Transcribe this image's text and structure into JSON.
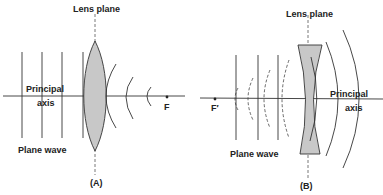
{
  "panel_a": {
    "lens_plane_label": "Lens plane",
    "principal_axis_line1": "Principal",
    "principal_axis_line2": "axis",
    "plane_wave_label": "Plane wave",
    "focal_point_label": "F",
    "caption": "(A)",
    "lens_type": "converging (convex)"
  },
  "panel_b": {
    "lens_plane_label": "Lens plane",
    "principal_axis_line1": "Principal",
    "principal_axis_line2": "axis",
    "plane_wave_label": "Plane wave",
    "focal_point_label": "F′",
    "caption": "(B)",
    "lens_type": "diverging (concave)"
  },
  "colors": {
    "lens_fill": "#c8c8c8",
    "stroke": "#333333",
    "background": "#ffffff"
  }
}
